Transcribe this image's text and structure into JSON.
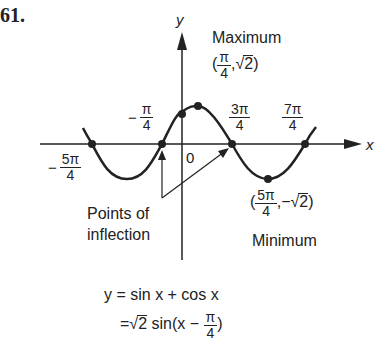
{
  "problem": {
    "number": "61."
  },
  "axes": {
    "x_label": "x",
    "y_label": "y",
    "origin_label": "0"
  },
  "ticks": {
    "neg_5pi_4": {
      "sign": "−",
      "num": "5π",
      "den": "4"
    },
    "neg_pi_4": {
      "sign": "−",
      "num": "π",
      "den": "4"
    },
    "three_pi_4": {
      "num": "3π",
      "den": "4"
    },
    "seven_pi_4": {
      "num": "7π",
      "den": "4"
    }
  },
  "annotations": {
    "maximum": {
      "title": "Maximum",
      "open": "(",
      "num": "π",
      "den": "4",
      "sep": ",",
      "value": "√",
      "radicand": "2",
      "close": ")"
    },
    "minimum": {
      "title": "Minimum",
      "open": "(",
      "num": "5π",
      "den": "4",
      "sep": ",",
      "value": "−√",
      "radicand": "2",
      "close": ")"
    },
    "inflection": {
      "line1": "Points of",
      "line2": "inflection"
    }
  },
  "equation": {
    "line1": "y = sin x + cos x",
    "line2_prefix": "=√",
    "line2_radicand": "2",
    "line2_mid": " sin(x − ",
    "line2_num": "π",
    "line2_den": "4",
    "line2_suffix": ")"
  },
  "colors": {
    "ink": "#222222",
    "background": "#ffffff"
  }
}
